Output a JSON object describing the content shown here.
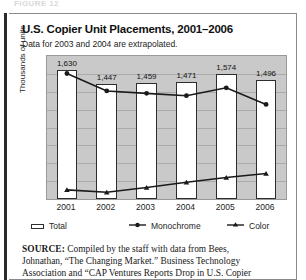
{
  "figure": {
    "number_strip": "FIGURE 12",
    "title": "U.S. Copier Unit Placements, 2001–2006",
    "subtitle": "Data for 2003 and 2004 are extrapolated."
  },
  "source": {
    "label": "SOURCE:",
    "line1": " Compiled by the staff with data from Bees,",
    "line2": "Johnathan, “The Changing Market.” Business Technology",
    "line3": "Association and “CAP Ventures Reports Drop in U.S. Copier"
  },
  "legend": {
    "total": "Total",
    "monochrome": "Monochrome",
    "color": "Color"
  },
  "colors": {
    "plot_background": "#c9c9c9",
    "gridline": "#aaaaaa",
    "bar_fill": "#ffffff",
    "bar_stroke": "#2d2d2d",
    "line": "#1a1a1a",
    "frame": "#8a8a8a",
    "left_rule": "#2a2a2a"
  },
  "chart_data": {
    "type": "bar",
    "title": "U.S. Copier Unit Placements, 2001–2006",
    "subtitle": "Data for 2003 and 2004 are extrapolated.",
    "xlabel": "",
    "ylabel": "Thousands of units",
    "categories": [
      "2001",
      "2002",
      "2003",
      "2004",
      "2005",
      "2006"
    ],
    "ylim": [
      0,
      1800
    ],
    "grid": true,
    "gridlines": 8,
    "legend_position": "bottom",
    "tick_labels_y": [],
    "series": [
      {
        "name": "Total",
        "type": "bar",
        "marker": "none",
        "values": [
          1630,
          1447,
          1459,
          1471,
          1574,
          1496
        ],
        "data_labels": [
          "1,630",
          "1,447",
          "1,459",
          "1,471",
          "1,574",
          "1,496"
        ]
      },
      {
        "name": "Monochrome",
        "type": "line",
        "marker": "circle",
        "values": [
          1580,
          1360,
          1330,
          1300,
          1400,
          1190
        ]
      },
      {
        "name": "Color",
        "type": "line",
        "marker": "triangle",
        "values": [
          115,
          85,
          145,
          210,
          270,
          320
        ]
      }
    ]
  }
}
